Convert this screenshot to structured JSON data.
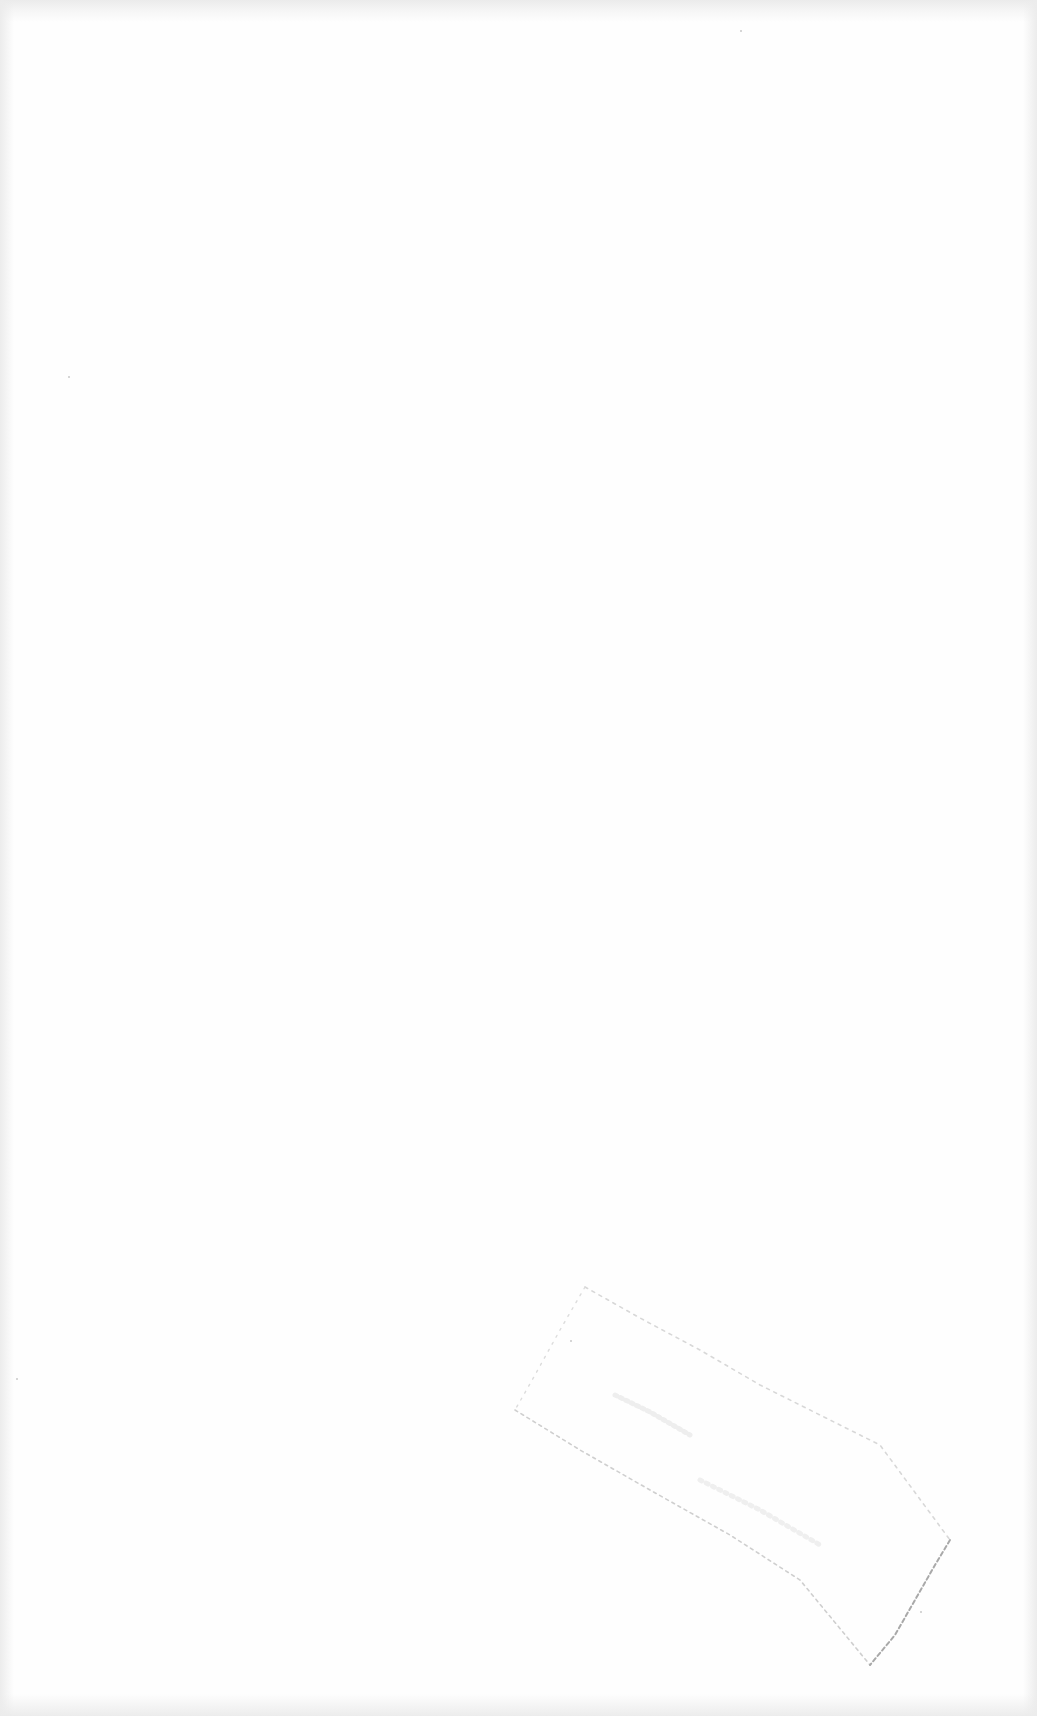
{
  "document": {
    "type": "scanned-blank-page",
    "text_lines": [],
    "stamp": {
      "shape": "rotated-rectangle-outline",
      "legible_text": ""
    }
  },
  "colors": {
    "paper": "#fefefe",
    "edge_shadow": "#ebebeb",
    "stamp_outline": "#b5b5b5"
  }
}
